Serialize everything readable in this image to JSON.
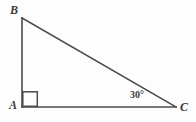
{
  "figure": {
    "type": "right-triangle",
    "caption": "",
    "background_color": "#fdfdfd",
    "stroke_color": "#4a4a4a",
    "label_color": "#3b3b3b",
    "stroke_width": 1.6,
    "canvas": {
      "width": 196,
      "height": 122
    },
    "vertices": [
      {
        "name": "A",
        "label": "A",
        "x": 22,
        "y": 107
      },
      {
        "name": "B",
        "label": "B",
        "x": 22,
        "y": 18
      },
      {
        "name": "C",
        "label": "C",
        "x": 176,
        "y": 107
      }
    ],
    "sides": [
      {
        "name": "AB",
        "from": "A",
        "to": "B",
        "role": "vertical-leg"
      },
      {
        "name": "AC",
        "from": "A",
        "to": "C",
        "role": "horizontal-leg"
      },
      {
        "name": "BC",
        "from": "B",
        "to": "C",
        "role": "hypotenuse"
      }
    ],
    "angles": [
      {
        "at": "A",
        "label": "",
        "measure": "90",
        "marker": "right-angle-square"
      },
      {
        "at": "C",
        "label": "30°",
        "measure": "30",
        "marker": "text"
      },
      {
        "at": "B",
        "label": "",
        "measure": "60",
        "marker": "none"
      }
    ],
    "right_angle_marker": {
      "vertex": "A",
      "size": 16,
      "x": 22,
      "y": 91
    }
  }
}
